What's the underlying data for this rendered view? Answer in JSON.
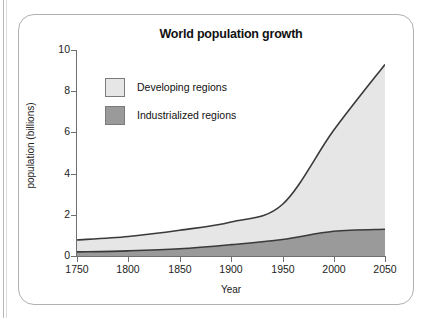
{
  "figure": {
    "border_color": "#b0b0b0",
    "background": "#ffffff"
  },
  "chart_data": {
    "type": "area",
    "stacked": true,
    "title": "World population growth",
    "xlabel": "Year",
    "ylabel": "population (billions)",
    "xlim": [
      1750,
      2050
    ],
    "ylim": [
      0,
      10
    ],
    "xticks": [
      1750,
      1800,
      1850,
      1900,
      1950,
      2000,
      2050
    ],
    "yticks": [
      0,
      2,
      4,
      6,
      8,
      10
    ],
    "grid": false,
    "legend_position": "inside upper-left",
    "x": [
      1750,
      1800,
      1850,
      1900,
      1950,
      2000,
      2050
    ],
    "series": [
      {
        "name": "Industrialized regions",
        "color": "#9a9a9a",
        "line_color": "#3a3a3a",
        "values": [
          0.2,
          0.25,
          0.35,
          0.55,
          0.8,
          1.2,
          1.3
        ]
      },
      {
        "name": "Developing regions",
        "color": "#e6e6e6",
        "line_color": "#3a3a3a",
        "values": [
          0.58,
          0.7,
          0.9,
          1.1,
          1.7,
          4.9,
          8.0
        ]
      }
    ],
    "total_values": [
      0.78,
      0.95,
      1.25,
      1.65,
      2.5,
      6.1,
      9.3
    ]
  },
  "legend": {
    "items": [
      {
        "label": "Developing regions",
        "swatch": "#e6e6e6"
      },
      {
        "label": "Industrialized regions",
        "swatch": "#9a9a9a"
      }
    ]
  },
  "axis_labels": {
    "y": [
      "10",
      "8",
      "6",
      "4",
      "2",
      "0"
    ],
    "x": [
      "1750",
      "1800",
      "1850",
      "1900",
      "1950",
      "2000",
      "2050"
    ]
  }
}
